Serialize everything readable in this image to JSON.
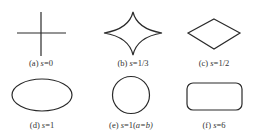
{
  "figure": {
    "stroke_color": "#2a2a2a",
    "background": "#ffffff",
    "panels": [
      {
        "id": "a",
        "prefix": "(a) ",
        "var": "s",
        "value": "=0",
        "suffix": "",
        "shape": "cross",
        "label": "(a) s=0"
      },
      {
        "id": "b",
        "prefix": "(b) ",
        "var": "s",
        "value": "=1/3",
        "suffix": "",
        "shape": "astroid",
        "label": "(b) s=1/3"
      },
      {
        "id": "c",
        "prefix": "(c) ",
        "var": "s",
        "value": "=1/2",
        "suffix": "",
        "shape": "diamond",
        "label": "(c) s=1/2"
      },
      {
        "id": "d",
        "prefix": "(d) ",
        "var": "s",
        "value": "=1",
        "suffix": "",
        "shape": "ellipse",
        "label": "(d) s=1"
      },
      {
        "id": "e",
        "prefix": "(e) ",
        "var": "s",
        "value": "=1(",
        "suffix": "a=b)",
        "shape": "circle",
        "label": "(e) s=1(a=b)"
      },
      {
        "id": "f",
        "prefix": "(f) ",
        "var": "s",
        "value": "=6",
        "suffix": "",
        "shape": "rounded-rectangle",
        "label": "(f) s=6"
      }
    ]
  }
}
